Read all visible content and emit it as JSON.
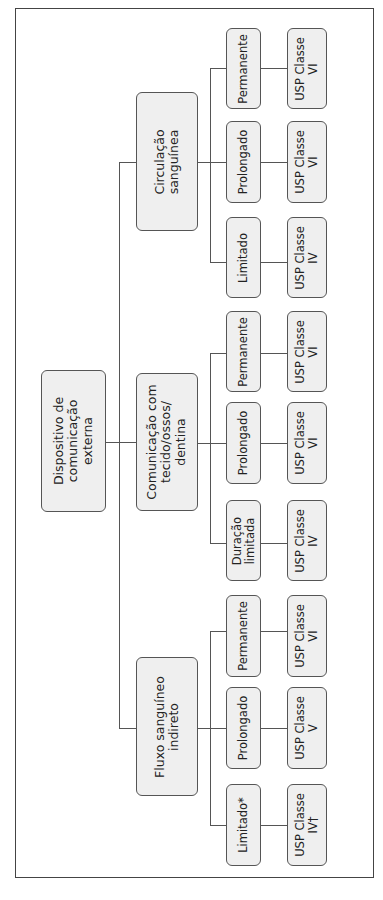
{
  "diagram": {
    "orientation": "rotated-90-ccw",
    "root": {
      "label": "Dispositivo de\ncomunicação\nexterna"
    },
    "categories": [
      {
        "label": "Circulação\nsanguínea",
        "children": [
          {
            "duration": "Limitado",
            "classification": "USP Classe\nIV"
          },
          {
            "duration": "Prolongado",
            "classification": "USP Classe\nVI"
          },
          {
            "duration": "Permanente",
            "classification": "USP Classe\nVI"
          }
        ]
      },
      {
        "label": "Comunicação com\ntecido/ossos/\ndentina",
        "children": [
          {
            "duration": "Duração\nlimitada",
            "classification": "USP Classe\nIV"
          },
          {
            "duration": "Prolongado",
            "classification": "USP Classe\nVI"
          },
          {
            "duration": "Permanente",
            "classification": "USP Classe\nVI"
          }
        ]
      },
      {
        "label": "Fluxo sanguíneo\nindireto",
        "children": [
          {
            "duration": "Limitado*",
            "classification": "USP Classe\nIV†"
          },
          {
            "duration": "Prolongado",
            "classification": "USP Classe\nV"
          },
          {
            "duration": "Permanente",
            "classification": "USP Classe\nVI"
          }
        ]
      }
    ]
  },
  "colors": {
    "box_fill": "#efefef",
    "line": "#555555",
    "text": "#222222"
  }
}
